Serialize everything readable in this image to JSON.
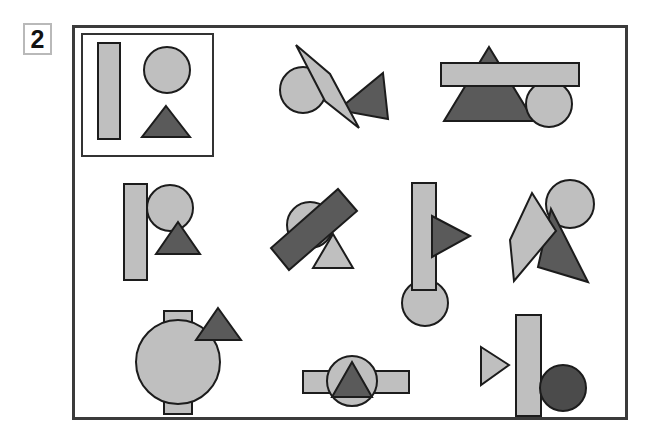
{
  "panel": {
    "number": "2",
    "badge_name": "panel-number-badge"
  },
  "palette": {
    "light_fill": "#bfbfbf",
    "mid_fill": "#a8a8a8",
    "dark_fill": "#5a5a5a",
    "darkest_fill": "#4b4b4b",
    "outline": "#1c1c1c",
    "frame_outline": "#3b3b3b",
    "badge_outline": "#b9b9b9",
    "background": "#ffffff"
  },
  "legend": {
    "title": "shape key",
    "items": [
      {
        "label": "rectangle",
        "shade": "light",
        "icon": "rectangle-icon"
      },
      {
        "label": "circle",
        "shade": "light",
        "icon": "circle-icon"
      },
      {
        "label": "triangle",
        "shade": "dark",
        "icon": "triangle-icon"
      }
    ]
  },
  "groups": [
    {
      "id": "group-1-key",
      "label": "key group",
      "members": [
        "rectangle-light-vertical",
        "circle-light",
        "triangle-dark"
      ]
    },
    {
      "id": "group-2",
      "label": "rotated rectangle over circle and triangle",
      "members": [
        "circle-light",
        "triangle-dark",
        "rectangle-light-rotated"
      ]
    },
    {
      "id": "group-3",
      "label": "bar over large triangle with circle",
      "members": [
        "triangle-dark-large",
        "circle-light",
        "rectangle-light-horizontal"
      ]
    },
    {
      "id": "group-4",
      "label": "vertical bar with circle and small triangle",
      "members": [
        "rectangle-light-vertical",
        "circle-light",
        "triangle-dark"
      ]
    },
    {
      "id": "group-5",
      "label": "dark rotated bar over circle and light triangle",
      "members": [
        "circle-light",
        "triangle-light",
        "rectangle-dark-rotated"
      ]
    },
    {
      "id": "group-6",
      "label": "vertical bar with right-pointing triangle and circle",
      "members": [
        "circle-light",
        "rectangle-light-vertical",
        "triangle-dark-right"
      ]
    },
    {
      "id": "group-7",
      "label": "rotated bar with circle and dark triangle",
      "members": [
        "circle-light",
        "triangle-dark",
        "rectangle-light-rotated"
      ]
    },
    {
      "id": "group-8",
      "label": "large circle over bar with triangle",
      "members": [
        "rectangle-light-vertical",
        "circle-light-large",
        "triangle-dark"
      ]
    },
    {
      "id": "group-9",
      "label": "horizontal bar with circle and centered triangle",
      "members": [
        "rectangle-light-horizontal",
        "circle-light",
        "triangle-dark"
      ]
    },
    {
      "id": "group-10",
      "label": "light triangle, bar and dark circle",
      "members": [
        "triangle-light-right",
        "rectangle-light-vertical",
        "circle-dark"
      ]
    }
  ],
  "counts": {
    "total_groups": "10",
    "shapes_per_group": "3"
  }
}
